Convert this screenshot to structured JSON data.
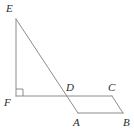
{
  "figure": {
    "kind": "geometry-diagram",
    "background_color": "#ffffff",
    "stroke_color": "#8c8c8c",
    "label_color": "#2b2b2b",
    "stroke_width": 1,
    "width": 134,
    "height": 135
  },
  "vertices": [
    {
      "id": "E",
      "label": "E",
      "x": 16,
      "y": 19,
      "label_x": 6,
      "label_y": 3
    },
    {
      "id": "F",
      "label": "F",
      "x": 16,
      "y": 96,
      "label_x": 4,
      "label_y": 97
    },
    {
      "id": "D",
      "label": "D",
      "x": 66,
      "y": 96,
      "label_x": 66,
      "label_y": 82
    },
    {
      "id": "C",
      "label": "C",
      "x": 112,
      "y": 96,
      "label_x": 108,
      "label_y": 82
    },
    {
      "id": "A",
      "label": "A",
      "x": 78,
      "y": 113,
      "label_x": 73,
      "label_y": 117
    },
    {
      "id": "B",
      "label": "B",
      "x": 123,
      "y": 113,
      "label_x": 123,
      "label_y": 117
    }
  ],
  "segments": [
    {
      "id": "EF",
      "name": "segment-ef",
      "x1": 16,
      "y1": 19,
      "x2": 16,
      "y2": 96
    },
    {
      "id": "FC",
      "name": "segment-fc",
      "x1": 16,
      "y1": 96,
      "x2": 112,
      "y2": 96
    },
    {
      "id": "EA",
      "name": "segment-ea",
      "x1": 16,
      "y1": 19,
      "x2": 78,
      "y2": 113
    },
    {
      "id": "AB",
      "name": "segment-ab",
      "x1": 78,
      "y1": 113,
      "x2": 123,
      "y2": 113
    },
    {
      "id": "CB",
      "name": "segment-cb",
      "x1": 112,
      "y1": 96,
      "x2": 123,
      "y2": 113
    }
  ],
  "right_angle": {
    "name": "right-angle-mark-at-f",
    "at_vertex": "F",
    "points": "16,89 23,89 23,96",
    "size": 7
  }
}
